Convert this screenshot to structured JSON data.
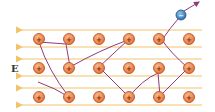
{
  "diagram": {
    "field_label": "E",
    "ion_sign": "+",
    "electron_sign": "−",
    "colors": {
      "field_line": "#f2c46a",
      "ion_fill": "#f08a4b",
      "ion_stroke": "#b0481c",
      "path": "#8e3b7f",
      "electron_fill": "#3f86c8",
      "electron_stroke": "#1f4f80"
    },
    "ion_columns_x": [
      39,
      69,
      99,
      129,
      159,
      189
    ],
    "ion_rows_y": [
      39,
      68,
      97
    ],
    "field_lines_y": [
      30,
      47,
      59,
      76,
      88,
      105
    ],
    "electron": {
      "x": 181,
      "y": 15
    }
  }
}
